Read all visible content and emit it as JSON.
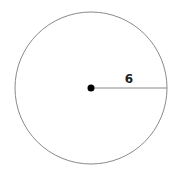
{
  "diagram": {
    "type": "circle",
    "radius_label": "6",
    "center": {
      "x": 91,
      "y": 88
    },
    "radius_px": 76,
    "stroke_color": "#8a8a8a",
    "center_dot_color": "#000000"
  }
}
